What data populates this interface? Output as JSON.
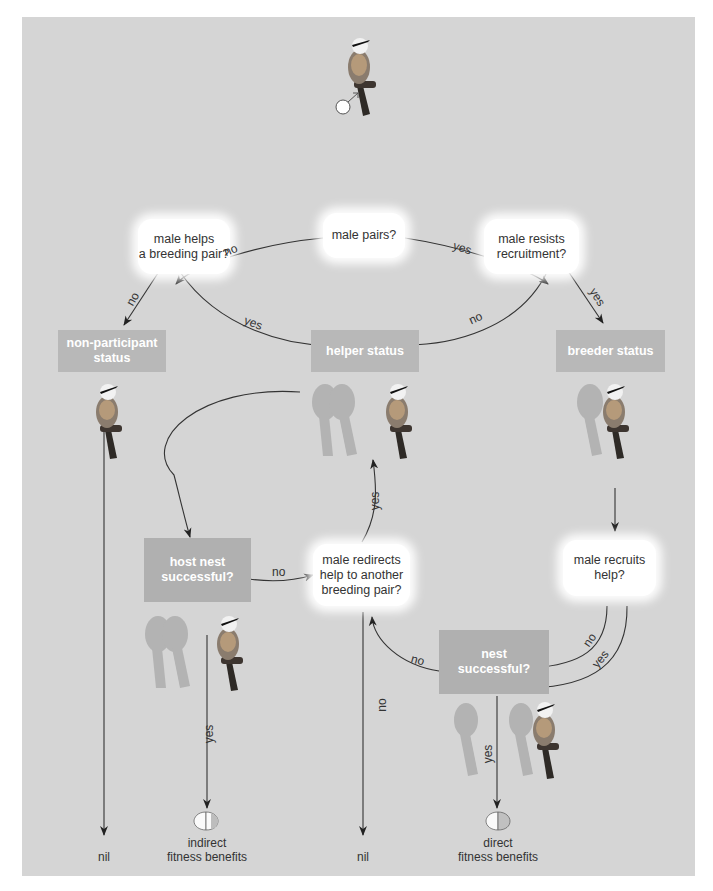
{
  "diagram": {
    "colors": {
      "panel": "#d5d5d5",
      "status_box": "#b8b8b8",
      "decision_box": "#ffffff",
      "line": "#333333"
    },
    "start": {
      "symbol": "male-symbol",
      "glyph": "♂"
    },
    "decisions": {
      "male_pairs": "male pairs?",
      "male_helps_line1": "male helps",
      "male_helps_line2": "a breeding pair?",
      "male_resists_line1": "male resists",
      "male_resists_line2": "recruitment?",
      "male_redirects_line1": "male redirects",
      "male_redirects_line2": "help to another",
      "male_redirects_line3": "breeding pair?",
      "male_recruits_line1": "male recruits",
      "male_recruits_line2": "help?",
      "host_nest_line1": "host nest",
      "host_nest_line2": "successful?",
      "nest_line1": "nest",
      "nest_line2": "successful?"
    },
    "statuses": {
      "non_participant_line1": "non-participant",
      "non_participant_line2": "status",
      "helper": "helper status",
      "breeder": "breeder status"
    },
    "edge_labels": {
      "pairs_no": "no",
      "pairs_yes": "yes",
      "helps_no": "no",
      "helps_yes": "yes",
      "resists_no": "no",
      "resists_yes": "yes",
      "redirect_yes": "yes",
      "host_no": "no",
      "host_yes": "yes",
      "redirect_no": "no",
      "recruits_no": "no",
      "recruits_yes": "yes",
      "nest_no": "no",
      "nest_yes": "yes"
    },
    "outcomes": {
      "nil_left": "nil",
      "nil_center": "nil",
      "indirect_line1": "indirect",
      "indirect_line2": "fitness benefits",
      "direct_line1": "direct",
      "direct_line2": "fitness benefits"
    }
  }
}
